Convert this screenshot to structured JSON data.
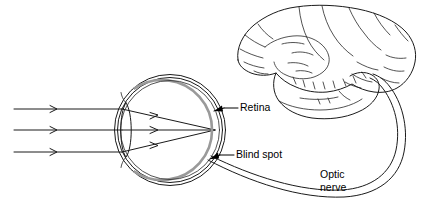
{
  "figure": {
    "background_color": "#ffffff",
    "line_color": "#1a1a1a",
    "retina_color": "#9a9a9a",
    "width": 425,
    "height": 206
  },
  "labels": {
    "retina": "Retina",
    "blind_spot": "Blind spot",
    "optic_nerve_line1": "Optic",
    "optic_nerve_line2": "nerve"
  },
  "parts": {
    "eyeball": "eyeball",
    "lens": "lens",
    "brain": "brain",
    "optic_nerve": "optic-nerve",
    "light_rays": "light-rays"
  },
  "light_rays": {
    "count": 3,
    "direction": "left-to-right",
    "y_positions": [
      109,
      130,
      152
    ],
    "focal_point": {
      "x": 215,
      "y": 130
    }
  },
  "geometry": {
    "eye_center": {
      "x": 170,
      "y": 130
    },
    "eye_radius": 55,
    "lens_center": {
      "x": 126,
      "y": 130
    },
    "blind_spot": {
      "x": 208,
      "y": 160
    }
  }
}
